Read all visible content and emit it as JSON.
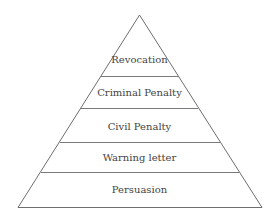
{
  "diagram": {
    "type": "pyramid",
    "levels_top_to_bottom": [
      {
        "label": "Revocation"
      },
      {
        "label": "Criminal Penalty"
      },
      {
        "label": "Civil Penalty"
      },
      {
        "label": "Warning letter"
      },
      {
        "label": "Persuasion"
      }
    ]
  },
  "colors": {
    "line": "#6e6e6e",
    "text": "#444444",
    "background": "#ffffff"
  }
}
